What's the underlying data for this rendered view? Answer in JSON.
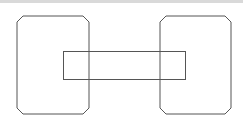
{
  "diagram": {
    "stroke_color": "#555555",
    "strip_color": "#d9d9d9",
    "shapes": [
      {
        "name": "left-rounded-box",
        "type": "chamfered-rect",
        "x": 17,
        "y": 16,
        "w": 72,
        "h": 98,
        "chamfer": 6
      },
      {
        "name": "right-rounded-box",
        "type": "chamfered-rect",
        "x": 160,
        "y": 16,
        "w": 71,
        "h": 98,
        "chamfer": 6
      },
      {
        "name": "connector-rect",
        "type": "rect",
        "x": 63,
        "y": 51,
        "w": 122,
        "h": 28
      }
    ]
  }
}
